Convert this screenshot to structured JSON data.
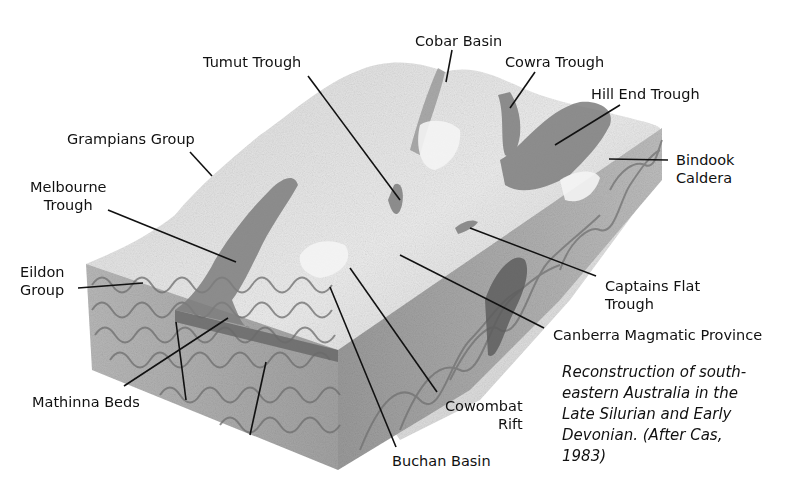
{
  "figure": {
    "caption": "Reconstruction of south-eastern Australia in the Late Silurian and Early Devonian. (After Cas, 1983)",
    "caption_lines": [
      "Reconstruction of south-",
      "eastern Australia in the",
      "Late Silurian and Early",
      "Devonian. (After Cas,",
      "1983)"
    ],
    "style": "grayscale 3D geological block diagram",
    "colors": {
      "background": "#ffffff",
      "surface_light": "#e6e6e6",
      "surface_mid": "#bdbdbd",
      "trough_dark": "#7d7d7d",
      "side_face": "#a8a8a8",
      "fold_lines": "#6e6e6e",
      "leader_line": "#111111"
    }
  },
  "labels": {
    "cobar_basin": "Cobar Basin",
    "cowra_trough": "Cowra Trough",
    "tumut_trough": "Tumut Trough",
    "hill_end_trough": "Hill End Trough",
    "grampians_group": "Grampians Group",
    "bindook_caldera": "Bindook\nCaldera",
    "melbourne_trough": "Melbourne\nTrough",
    "eildon_group": "Eildon\nGroup",
    "captains_flat_trough": "Captains Flat\nTrough",
    "canberra_magmatic_province": "Canberra Magmatic Province",
    "mathinna_beds": "Mathinna Beds",
    "cowombat_rift": "Cowombat\nRift",
    "buchan_basin": "Buchan Basin"
  }
}
